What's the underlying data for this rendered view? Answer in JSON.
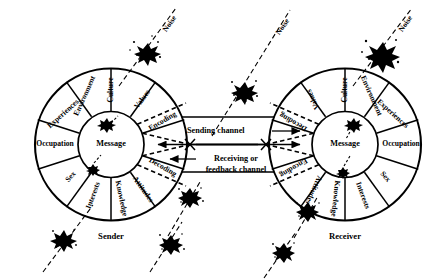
{
  "diagram": {
    "sender": {
      "role_label": "Sender",
      "hub_label": "Message",
      "segments": [
        {
          "label": "Culture"
        },
        {
          "label": "Values"
        },
        {
          "label": "Encoding"
        },
        {
          "label": "Decoding"
        },
        {
          "label": "Attitudes"
        },
        {
          "label": "Knowledge"
        },
        {
          "label": "Interests"
        },
        {
          "label": "Sex"
        },
        {
          "label": "Occupation"
        },
        {
          "label": "Experiences"
        },
        {
          "label": "Environment"
        }
      ]
    },
    "receiver": {
      "role_label": "Receiver",
      "hub_label": "Message",
      "segments": [
        {
          "label": "Culture"
        },
        {
          "label": "Values"
        },
        {
          "label": "Decoding"
        },
        {
          "label": "Encoding"
        },
        {
          "label": "Attitudes"
        },
        {
          "label": "Knowledge"
        },
        {
          "label": "Interests"
        },
        {
          "label": "Sex"
        },
        {
          "label": "Occupation"
        },
        {
          "label": "Experiences"
        },
        {
          "label": "Environment"
        }
      ]
    },
    "channels": {
      "sending": "Sending channel",
      "feedback_line1": "Receiving or",
      "feedback_line2": "feedback channel"
    },
    "noise": {
      "label": "Noise",
      "labeled_count": 3,
      "unlabeled_count": 5
    },
    "colors": {
      "ink": "#000000",
      "paper": "#ffffff"
    }
  }
}
